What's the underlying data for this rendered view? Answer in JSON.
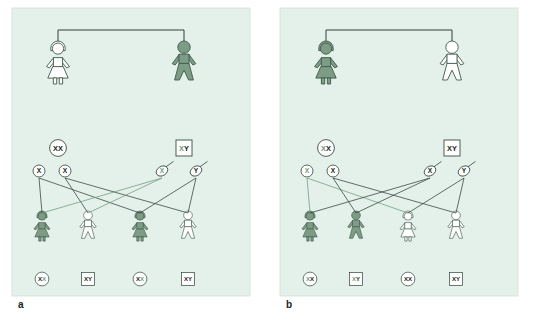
{
  "figure": {
    "background_color": "#ffffff",
    "panel_background_color": "#e4f0ea",
    "affected_fill_color": "#7d9c85",
    "unaffected_fill_color": "#ffffff",
    "outline_color": "#3f5a4a",
    "line_color_dark": "#2e4338",
    "line_color_green": "#6e9a7e"
  },
  "panels": [
    {
      "id": "a",
      "label": "a",
      "parents": [
        {
          "role": "mother",
          "sex": "female",
          "affected": false,
          "genotype": "XX",
          "genotype_shape": "circle",
          "genotype_letters": [
            {
              "text": "X",
              "color": "dark"
            },
            {
              "text": "X",
              "color": "dark"
            }
          ]
        },
        {
          "role": "father",
          "sex": "male",
          "affected": true,
          "genotype": "XY",
          "genotype_shape": "square",
          "genotype_letters": [
            {
              "text": "X",
              "color": "green"
            },
            {
              "text": "Y",
              "color": "dark"
            }
          ]
        }
      ],
      "gametes": [
        {
          "type": "egg",
          "label": "X",
          "color": "dark",
          "from": "mother"
        },
        {
          "type": "egg",
          "label": "X",
          "color": "dark",
          "from": "mother"
        },
        {
          "type": "sperm",
          "label": "X",
          "color": "green",
          "from": "father"
        },
        {
          "type": "sperm",
          "label": "Y",
          "color": "dark",
          "from": "father"
        }
      ],
      "children": [
        {
          "sex": "female",
          "affected": true,
          "genotype": "XX",
          "genotype_shape": "circle",
          "genotype_letters": [
            {
              "text": "X",
              "color": "dark"
            },
            {
              "text": "X",
              "color": "green"
            }
          ]
        },
        {
          "sex": "male",
          "affected": false,
          "genotype": "XY",
          "genotype_shape": "square",
          "genotype_letters": [
            {
              "text": "X",
              "color": "dark"
            },
            {
              "text": "Y",
              "color": "dark"
            }
          ]
        },
        {
          "sex": "female",
          "affected": true,
          "genotype": "XX",
          "genotype_shape": "circle",
          "genotype_letters": [
            {
              "text": "X",
              "color": "dark"
            },
            {
              "text": "X",
              "color": "green"
            }
          ]
        },
        {
          "sex": "male",
          "affected": false,
          "genotype": "XY",
          "genotype_shape": "square",
          "genotype_letters": [
            {
              "text": "X",
              "color": "dark"
            },
            {
              "text": "Y",
              "color": "dark"
            }
          ]
        }
      ]
    },
    {
      "id": "b",
      "label": "b",
      "parents": [
        {
          "role": "mother",
          "sex": "female",
          "affected": true,
          "genotype": "XX",
          "genotype_shape": "circle",
          "genotype_letters": [
            {
              "text": "X",
              "color": "green"
            },
            {
              "text": "X",
              "color": "dark"
            }
          ]
        },
        {
          "role": "father",
          "sex": "male",
          "affected": false,
          "genotype": "XY",
          "genotype_shape": "square",
          "genotype_letters": [
            {
              "text": "X",
              "color": "dark"
            },
            {
              "text": "Y",
              "color": "dark"
            }
          ]
        }
      ],
      "gametes": [
        {
          "type": "egg",
          "label": "X",
          "color": "green",
          "from": "mother"
        },
        {
          "type": "egg",
          "label": "X",
          "color": "dark",
          "from": "mother"
        },
        {
          "type": "sperm",
          "label": "X",
          "color": "dark",
          "from": "father"
        },
        {
          "type": "sperm",
          "label": "Y",
          "color": "dark",
          "from": "father"
        }
      ],
      "children": [
        {
          "sex": "female",
          "affected": true,
          "genotype": "XX",
          "genotype_shape": "circle",
          "genotype_letters": [
            {
              "text": "X",
              "color": "green"
            },
            {
              "text": "X",
              "color": "dark"
            }
          ]
        },
        {
          "sex": "male",
          "affected": true,
          "genotype": "XY",
          "genotype_shape": "square",
          "genotype_letters": [
            {
              "text": "X",
              "color": "green"
            },
            {
              "text": "Y",
              "color": "dark"
            }
          ]
        },
        {
          "sex": "female",
          "affected": false,
          "genotype": "XX",
          "genotype_shape": "circle",
          "genotype_letters": [
            {
              "text": "X",
              "color": "dark"
            },
            {
              "text": "X",
              "color": "dark"
            }
          ]
        },
        {
          "sex": "male",
          "affected": false,
          "genotype": "XY",
          "genotype_shape": "square",
          "genotype_letters": [
            {
              "text": "X",
              "color": "dark"
            },
            {
              "text": "Y",
              "color": "dark"
            }
          ]
        }
      ]
    }
  ]
}
